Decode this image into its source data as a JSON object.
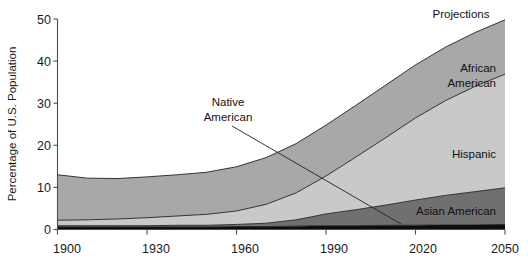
{
  "chart_data": {
    "type": "area",
    "stacked": true,
    "title": "",
    "xlabel": "",
    "ylabel": "Percentage of U.S. Population",
    "xlim": [
      1900,
      2050
    ],
    "ylim": [
      0,
      50
    ],
    "grid": false,
    "legend_position": "inline-labels",
    "x_ticks": [
      "1900",
      "1930",
      "1960",
      "1990",
      "2020",
      "2050"
    ],
    "x_tick_values": [
      1900,
      1930,
      1960,
      1990,
      2020,
      2050
    ],
    "y_ticks": [
      "0",
      "10",
      "20",
      "30",
      "40",
      "50"
    ],
    "y_tick_values": [
      0,
      10,
      20,
      30,
      40,
      50
    ],
    "x": [
      1900,
      1910,
      1920,
      1930,
      1940,
      1950,
      1960,
      1970,
      1980,
      1990,
      2000,
      2010,
      2020,
      2030,
      2040,
      2050
    ],
    "series": [
      {
        "name": "Native American",
        "color": "#0d0d0d",
        "values": [
          0.6,
          0.6,
          0.6,
          0.6,
          0.6,
          0.6,
          0.7,
          0.7,
          0.8,
          0.9,
          0.9,
          1.0,
          1.0,
          1.1,
          1.1,
          1.2
        ]
      },
      {
        "name": "Asian American",
        "color": "#707070",
        "values": [
          0.3,
          0.3,
          0.3,
          0.3,
          0.4,
          0.4,
          0.5,
          0.8,
          1.5,
          2.8,
          3.8,
          4.8,
          6.0,
          7.0,
          7.9,
          8.7
        ]
      },
      {
        "name": "Hispanic",
        "color": "#c9c9c9",
        "values": [
          1.3,
          1.4,
          1.6,
          1.9,
          2.2,
          2.6,
          3.2,
          4.5,
          6.4,
          9.0,
          12.5,
          16.0,
          19.5,
          22.5,
          25.0,
          27.0
        ]
      },
      {
        "name": "African American",
        "color": "#a8a8a8",
        "values": [
          10.8,
          9.9,
          9.6,
          9.7,
          9.8,
          10.0,
          10.5,
          11.1,
          11.7,
          12.1,
          12.3,
          12.5,
          12.6,
          12.7,
          12.8,
          12.9
        ]
      }
    ],
    "annotations": [
      {
        "text": "Projections",
        "kind": "region-label"
      },
      {
        "text": "African American",
        "kind": "series-label",
        "lines": [
          "African",
          "American"
        ]
      },
      {
        "text": "Hispanic",
        "kind": "series-label",
        "lines": [
          "Hispanic"
        ]
      },
      {
        "text": "Asian American",
        "kind": "series-label",
        "lines": [
          "Asian American"
        ]
      },
      {
        "text": "Native American",
        "kind": "callout-label",
        "lines": [
          "Native",
          "American"
        ]
      }
    ]
  },
  "labels": {
    "y_axis_title": "Percentage of U.S. Population",
    "projections": "Projections",
    "african_american_line1": "African",
    "african_american_line2": "American",
    "hispanic": "Hispanic",
    "asian_american": "Asian American",
    "native_american_line1": "Native",
    "native_american_line2": "American",
    "x_tick_0": "1900",
    "x_tick_1": "1930",
    "x_tick_2": "1960",
    "x_tick_3": "1990",
    "x_tick_4": "2020",
    "x_tick_5": "2050",
    "y_tick_0": "0",
    "y_tick_1": "10",
    "y_tick_2": "20",
    "y_tick_3": "30",
    "y_tick_4": "40",
    "y_tick_5": "50"
  },
  "colors": {
    "native_american": "#0d0d0d",
    "asian_american": "#707070",
    "hispanic": "#c9c9c9",
    "african_american": "#a8a8a8",
    "axis": "#4d4d4d",
    "background": "#ffffff"
  }
}
